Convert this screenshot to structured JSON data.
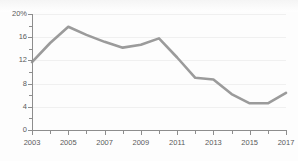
{
  "chart_data": {
    "type": "line",
    "title": "",
    "xlabel": "",
    "ylabel": "",
    "x": [
      2003,
      2004,
      2005,
      2006,
      2007,
      2008,
      2009,
      2010,
      2011,
      2012,
      2013,
      2014,
      2015,
      2016,
      2017
    ],
    "values": [
      11.7,
      15.0,
      17.8,
      16.4,
      15.2,
      14.2,
      14.7,
      15.8,
      12.5,
      9.0,
      8.7,
      6.2,
      4.6,
      4.6,
      6.4
    ],
    "series": [
      {
        "name": "rate",
        "values": [
          11.7,
          15.0,
          17.8,
          16.4,
          15.2,
          14.2,
          14.7,
          15.8,
          12.5,
          9.0,
          8.7,
          6.2,
          4.6,
          4.6,
          6.4
        ]
      }
    ],
    "xlim": [
      2003,
      2017
    ],
    "ylim": [
      0,
      20
    ],
    "ytick_values": [
      0,
      2,
      4,
      6,
      8,
      10,
      12,
      14,
      16,
      18,
      20
    ],
    "ytick_major": [
      0,
      4,
      8,
      12,
      16,
      20
    ],
    "ytick_labels": [
      "0",
      "4",
      "8",
      "12",
      "16",
      "20%"
    ],
    "xtick_major": [
      2003,
      2005,
      2007,
      2009,
      2011,
      2013,
      2015,
      2017
    ],
    "xtick_labels": [
      "2003",
      "2005",
      "2007",
      "2009",
      "2011",
      "2013",
      "2015",
      "2017"
    ],
    "xtick_minor": [
      2004,
      2006,
      2008,
      2010,
      2012,
      2014,
      2016
    ],
    "grid": "horizontal",
    "legend": "none",
    "line_color": "#9b9b9b",
    "axis_color": "#8d8d8d",
    "grid_color": "#f0f0f0",
    "background_color": "#ffffff",
    "line_width": 2.6
  }
}
